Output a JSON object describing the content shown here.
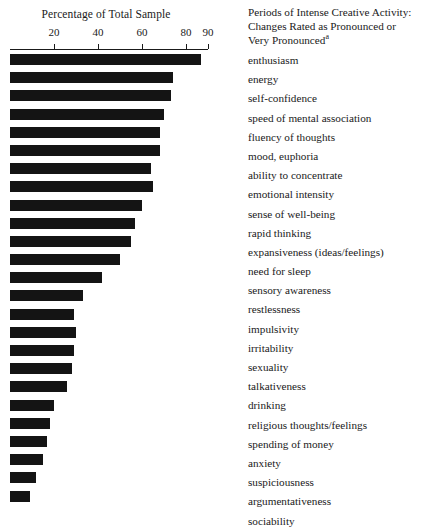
{
  "chart_data": {
    "type": "bar",
    "orientation": "horizontal",
    "title": "Percentage of Total Sample",
    "xlabel": "Percentage of Total Sample",
    "ylabel": "",
    "xlim": [
      0,
      90
    ],
    "xticks": [
      20,
      40,
      60,
      80,
      90
    ],
    "xtick_labels": [
      "20",
      "40",
      "60",
      "80",
      "90"
    ],
    "grid": false,
    "legend": null,
    "series_name": "Periods of Intense Creative Activity",
    "categories": [
      "enthusiasm",
      "energy",
      "self-confidence",
      "speed of mental association",
      "fluency of thoughts",
      "mood, euphoria",
      "ability to concentrate",
      "emotional intensity",
      "sense of well-being",
      "rapid thinking",
      "expansiveness (ideas/feelings)",
      "need for sleep",
      "sensory awareness",
      "restlessness",
      "impulsivity",
      "irritability",
      "sexuality",
      "talkativeness",
      "drinking",
      "religious thoughts/feelings",
      "spending of money",
      "anxiety",
      "suspiciousness",
      "argumentativeness",
      "sociability"
    ],
    "values": [
      87,
      74,
      73,
      70,
      68,
      68,
      64,
      65,
      60,
      57,
      55,
      50,
      42,
      33,
      29,
      30,
      29,
      28,
      26,
      20,
      18,
      17,
      15,
      12,
      9
    ]
  },
  "chart": {
    "title": "Percentage of Total Sample",
    "axis": {
      "ticks": [
        {
          "label": "20",
          "value": 20
        },
        {
          "label": "40",
          "value": 40
        },
        {
          "label": "60",
          "value": 60
        },
        {
          "label": "80",
          "value": 80
        },
        {
          "label": "90",
          "value": 90
        }
      ]
    }
  },
  "labels": {
    "header_line1": "Periods of Intense Creative Activity:",
    "header_line2": "Changes Rated as Pronounced or",
    "header_line3": "Very Pronounced",
    "header_footnote": "a",
    "items": [
      "enthusiasm",
      "energy",
      "self-confidence",
      "speed of mental association",
      "fluency of thoughts",
      "mood, euphoria",
      "ability to concentrate",
      "emotional intensity",
      "sense of well-being",
      "rapid thinking",
      "expansiveness (ideas/feelings)",
      "need for sleep",
      "sensory awareness",
      "restlessness",
      "impulsivity",
      "irritability",
      "sexuality",
      "talkativeness",
      "drinking",
      "religious thoughts/feelings",
      "spending of money",
      "anxiety",
      "suspiciousness",
      "argumentativeness",
      "sociability"
    ]
  },
  "colors": {
    "bar": "#141414",
    "text": "#1a1a1a",
    "background": "#ffffff"
  }
}
